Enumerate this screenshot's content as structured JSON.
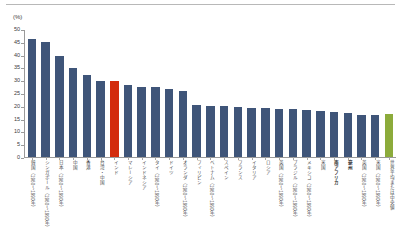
{
  "unit_label": "(%)",
  "colors": {
    "bar_default": "#3f5579",
    "bar_highlight_red": "#d32b0c",
    "bar_highlight_green": "#8cab3b",
    "axis": "#9a9a9a",
    "text": "#4a4a4a",
    "top_rule": "#b8b8b8"
  },
  "chart_data": {
    "type": "bar",
    "title": "",
    "subtitle": "",
    "xlabel": "",
    "ylabel": "(%)",
    "ylim": [
      0,
      50
    ],
    "ytick_step": 5,
    "yticks": [
      0,
      5,
      10,
      15,
      20,
      25,
      30,
      35,
      40,
      45,
      50
    ],
    "grid": false,
    "legend": false,
    "legend_position": "none",
    "categories": [
      "韓国（1960～1990年）",
      "シンガポール（1960～1990年）",
      "日本（1960～1990年）",
      "中国",
      "香港",
      "台湾・中国",
      "インド",
      "マレーシア",
      "インドネシア",
      "タイ（1960～1990年）",
      "ドイツ",
      "オランダ（1960～1990年）",
      "フィリピン",
      "ベトナム（1960～1990年）",
      "スペイン",
      "フランス",
      "イタリア",
      "ロシア",
      "英国（1960～1990年）",
      "ブラジル（1960～1990年）",
      "メキシコ（1960～1990年）",
      "米国",
      "南アフリカ",
      "豪州",
      "英国（1960～1990年）",
      "米国（1960～1990年）",
      "世界平均または中央値"
    ],
    "values": [
      46.2,
      45.1,
      39.5,
      34.7,
      32.0,
      29.5,
      29.5,
      28.2,
      27.5,
      27.5,
      26.4,
      25.6,
      20.4,
      20.1,
      19.8,
      19.6,
      19.2,
      19.0,
      18.9,
      18.7,
      18.3,
      17.8,
      17.5,
      17.2,
      16.6,
      16.5,
      16.8
    ],
    "highlights": {
      "6": "red",
      "26": "green"
    },
    "bold_labels": [
      22,
      23
    ]
  }
}
